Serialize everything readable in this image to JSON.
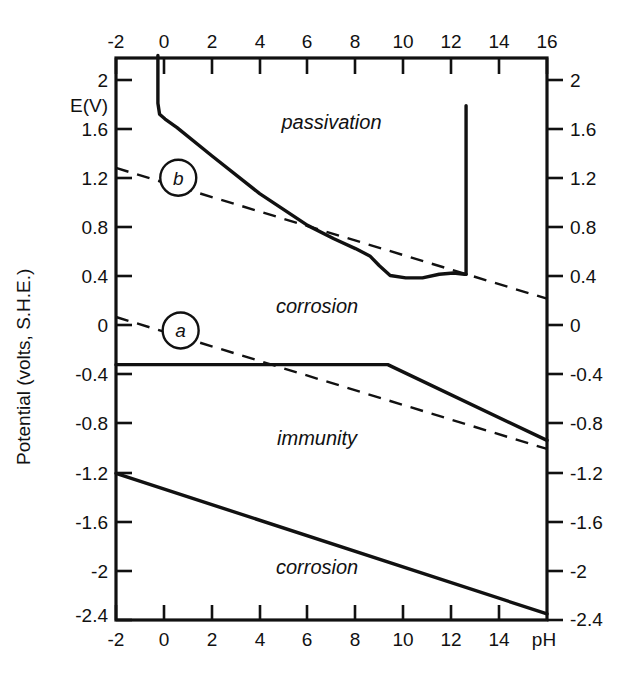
{
  "figure": {
    "kind": "pourbaix-diagram",
    "background": "#ffffff",
    "ink_color": "#111111"
  },
  "axes": {
    "y_caption": "Potential (volts, S.H.E.)",
    "y_inner_label": "E(V)",
    "x_caption": "pH",
    "x_tick_labels": [
      "-2",
      "0",
      "2",
      "4",
      "6",
      "8",
      "10",
      "12",
      "14",
      "16"
    ],
    "x_tick_labels_bottom": [
      "-2",
      "0",
      "2",
      "4",
      "6",
      "8",
      "10",
      "12",
      "14"
    ],
    "y_tick_labels": [
      "2",
      "1.6",
      "1.2",
      "0.8",
      "0.4",
      "0",
      "-0.4",
      "-0.8",
      "-1.2",
      "-1.6",
      "-2",
      "-2.4"
    ]
  },
  "regions": [
    {
      "id": "passivation-upper",
      "label": "passivation"
    },
    {
      "id": "corrosion-upper",
      "label": "corrosion"
    },
    {
      "id": "immunity",
      "label": "immunity"
    },
    {
      "id": "corrosion-lower",
      "label": "corrosion"
    }
  ],
  "markers": [
    {
      "id": "marker-b",
      "label": "b"
    },
    {
      "id": "marker-a",
      "label": "a"
    }
  ],
  "chart_data": {
    "type": "line",
    "title": "",
    "subtitle": "",
    "xlabel": "pH",
    "ylabel": "Potential (volts, S.H.E.)",
    "xlim": [
      -2,
      16
    ],
    "ylim": [
      -2.4,
      2.2
    ],
    "xticks": [
      -2,
      0,
      2,
      4,
      6,
      8,
      10,
      12,
      14,
      16
    ],
    "yticks": [
      2,
      1.6,
      1.2,
      0.8,
      0.4,
      0,
      -0.4,
      -0.8,
      -1.2,
      -1.6,
      -2,
      -2.4
    ],
    "grid": false,
    "legend": "none",
    "annotations": [
      {
        "text": "passivation",
        "x": 7.0,
        "y": 1.62,
        "style": "italic"
      },
      {
        "text": "corrosion",
        "x": 6.4,
        "y": 0.11,
        "style": "italic"
      },
      {
        "text": "immunity",
        "x": 6.4,
        "y": -0.97,
        "style": "italic"
      },
      {
        "text": "corrosion",
        "x": 6.4,
        "y": -2.02,
        "style": "italic"
      },
      {
        "text": "E(V)",
        "x": -2.6,
        "y": 1.87,
        "style": "plain"
      },
      {
        "text": "b",
        "x": 0.6,
        "y": 1.22,
        "style": "italic-circled"
      },
      {
        "text": "a",
        "x": 0.7,
        "y": -0.03,
        "style": "italic-circled"
      }
    ],
    "series": [
      {
        "name": "passivation-boundary",
        "linestyle": "solid",
        "points": [
          [
            -0.25,
            2.22
          ],
          [
            -0.25,
            1.83
          ],
          [
            -0.18,
            1.74
          ],
          [
            0.05,
            1.7
          ],
          [
            0.55,
            1.63
          ],
          [
            2.0,
            1.4
          ],
          [
            4.0,
            1.09
          ],
          [
            6.0,
            0.83
          ],
          [
            7.1,
            0.72
          ],
          [
            8.0,
            0.64
          ],
          [
            8.6,
            0.58
          ],
          [
            9.0,
            0.5
          ],
          [
            9.45,
            0.42
          ],
          [
            10.1,
            0.4
          ],
          [
            10.8,
            0.4
          ],
          [
            11.5,
            0.43
          ],
          [
            12.1,
            0.44
          ],
          [
            12.55,
            0.43
          ],
          [
            12.62,
            0.43
          ]
        ]
      },
      {
        "name": "passivation-vertical-boundary",
        "linestyle": "solid",
        "points": [
          [
            12.62,
            0.43
          ],
          [
            12.62,
            1.81
          ]
        ]
      },
      {
        "name": "immunity-upper-boundary",
        "linestyle": "solid",
        "points": [
          [
            -2.0,
            -0.31
          ],
          [
            9.35,
            -0.31
          ],
          [
            16.0,
            -0.93
          ]
        ]
      },
      {
        "name": "lower-corrosion-boundary",
        "linestyle": "solid",
        "points": [
          [
            -2.0,
            -1.2
          ],
          [
            16.0,
            -2.35
          ]
        ]
      },
      {
        "name": "b-line-oxygen",
        "linestyle": "dashed",
        "points": [
          [
            -2.0,
            1.3
          ],
          [
            16.0,
            0.23
          ]
        ]
      },
      {
        "name": "a-line-hydrogen",
        "linestyle": "dashed",
        "points": [
          [
            -2.0,
            0.08
          ],
          [
            16.0,
            -1.0
          ]
        ]
      }
    ]
  }
}
